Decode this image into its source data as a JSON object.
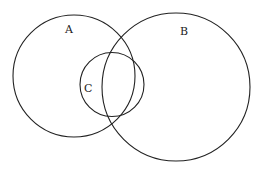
{
  "diagram": {
    "type": "venn",
    "sets": [
      {
        "id": "A",
        "label": "A"
      },
      {
        "id": "B",
        "label": "B"
      },
      {
        "id": "C",
        "label": "C"
      }
    ],
    "relations": {
      "A_overlaps_B": true,
      "C_overlaps_A": true,
      "C_overlaps_B": true
    },
    "stroke_color": "#222222",
    "background": "#ffffff"
  }
}
